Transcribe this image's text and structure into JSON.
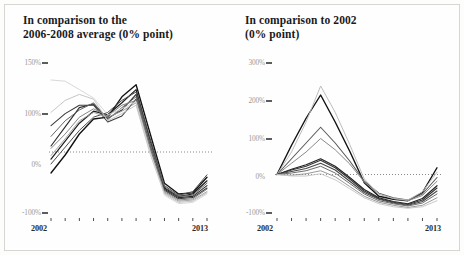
{
  "page": {
    "background_color": "#fdfdfc",
    "frame_color": "#d8d6d2"
  },
  "charts": [
    {
      "id": "left",
      "title": "In comparison to the\n2006-2008 average (0% point)",
      "title_line1": "In comparison to the",
      "title_line2": "2006-2008 average (0% point)",
      "y_ticks": [
        "150%",
        "100%",
        "0%",
        "-100%"
      ],
      "x_start_label": "2002",
      "x_end_label": "2013"
    },
    {
      "id": "right",
      "title": "In comparison to 2002\n(0% point)",
      "title_line1": "In comparison to 2002",
      "title_line2": "(0% point)",
      "y_ticks": [
        "300%",
        "200%",
        "100%",
        "0%",
        "-100%"
      ],
      "x_start_label": "2002",
      "x_end_label": "2013"
    }
  ],
  "chart_data": [
    {
      "type": "line",
      "title": "In comparison to the 2006-2008 average (0% point)",
      "xlabel": "",
      "ylabel": "",
      "x": [
        2002,
        2003,
        2004,
        2005,
        2006,
        2007,
        2008,
        2009,
        2010,
        2011,
        2012,
        2013
      ],
      "xlim": [
        2002,
        2013
      ],
      "ylim": [
        -100,
        150
      ],
      "ytick_values": [
        150,
        100,
        0,
        -100
      ],
      "ytick_labels": [
        "150%",
        "100%",
        "0%",
        "-100%"
      ],
      "grid": false,
      "zero_line": true,
      "zero_line_style": "dotted",
      "legend": "none",
      "series": [
        {
          "name": "series-1",
          "color": "#111111",
          "width": 1.35,
          "values": [
            -35,
            -5,
            30,
            55,
            58,
            92,
            112,
            30,
            -52,
            -70,
            -68,
            -42
          ]
        },
        {
          "name": "series-2",
          "color": "#1c1c1c",
          "width": 1.2,
          "values": [
            -12,
            18,
            48,
            68,
            62,
            82,
            104,
            18,
            -60,
            -74,
            -70,
            -48
          ]
        },
        {
          "name": "series-3",
          "color": "#2b2b2b",
          "width": 1.1,
          "values": [
            10,
            42,
            74,
            80,
            56,
            70,
            96,
            10,
            -62,
            -76,
            -74,
            -56
          ]
        },
        {
          "name": "series-4",
          "color": "#3a3a3a",
          "width": 1.05,
          "values": [
            44,
            64,
            78,
            78,
            50,
            60,
            88,
            4,
            -64,
            -78,
            -76,
            -60
          ]
        },
        {
          "name": "series-5",
          "color": "#4d4d4d",
          "width": 1.0,
          "values": [
            -20,
            8,
            36,
            58,
            66,
            86,
            100,
            22,
            -56,
            -72,
            -66,
            -38
          ]
        },
        {
          "name": "series-6",
          "color": "#666666",
          "width": 1.0,
          "values": [
            26,
            52,
            70,
            82,
            54,
            74,
            92,
            14,
            -58,
            -74,
            -72,
            -52
          ]
        },
        {
          "name": "series-7",
          "color": "#808080",
          "width": 0.95,
          "values": [
            6,
            30,
            58,
            72,
            60,
            78,
            86,
            8,
            -66,
            -80,
            -78,
            -62
          ]
        },
        {
          "name": "series-8",
          "color": "#9a9a9a",
          "width": 0.9,
          "values": [
            -6,
            22,
            52,
            66,
            58,
            68,
            82,
            2,
            -68,
            -82,
            -80,
            -66
          ]
        },
        {
          "name": "series-9",
          "color": "#bfbfbf",
          "width": 0.9,
          "values": [
            66,
            86,
            96,
            88,
            52,
            64,
            78,
            -4,
            -70,
            -84,
            -82,
            -68
          ]
        },
        {
          "name": "series-10",
          "color": "#d4d4d4",
          "width": 0.9,
          "values": [
            120,
            118,
            104,
            90,
            62,
            72,
            84,
            0,
            -72,
            -86,
            -84,
            -70
          ]
        }
      ]
    },
    {
      "type": "line",
      "title": "In comparison to 2002 (0% point)",
      "xlabel": "",
      "ylabel": "",
      "x": [
        2002,
        2003,
        2004,
        2005,
        2006,
        2007,
        2008,
        2009,
        2010,
        2011,
        2012,
        2013
      ],
      "xlim": [
        2002,
        2013
      ],
      "ylim": [
        -100,
        300
      ],
      "ytick_values": [
        300,
        200,
        100,
        0,
        -100
      ],
      "ytick_labels": [
        "300%",
        "200%",
        "100%",
        "0%",
        "-100%"
      ],
      "grid": false,
      "zero_line": true,
      "zero_line_style": "dotted",
      "legend": "none",
      "series": [
        {
          "name": "series-1",
          "color": "#111111",
          "width": 1.4,
          "values": [
            0,
            78,
            150,
            212,
            140,
            62,
            -22,
            -58,
            -66,
            -70,
            -48,
            18
          ]
        },
        {
          "name": "series-2",
          "color": "#5a5a5a",
          "width": 1.1,
          "values": [
            0,
            42,
            84,
            126,
            84,
            36,
            -18,
            -50,
            -62,
            -68,
            -52,
            -8
          ]
        },
        {
          "name": "series-3",
          "color": "#8a8a8a",
          "width": 1.0,
          "values": [
            0,
            30,
            60,
            96,
            66,
            28,
            -20,
            -52,
            -64,
            -70,
            -56,
            -18
          ]
        },
        {
          "name": "series-4",
          "color": "#b8b8b8",
          "width": 0.95,
          "values": [
            0,
            60,
            140,
            236,
            166,
            80,
            -12,
            -52,
            -64,
            -68,
            -46,
            6
          ]
        },
        {
          "name": "series-5",
          "color": "#222222",
          "width": 1.2,
          "values": [
            0,
            14,
            26,
            42,
            22,
            -8,
            -40,
            -62,
            -72,
            -78,
            -64,
            -30
          ]
        },
        {
          "name": "series-6",
          "color": "#333333",
          "width": 1.1,
          "values": [
            0,
            12,
            22,
            38,
            18,
            -12,
            -44,
            -64,
            -74,
            -80,
            -68,
            -36
          ]
        },
        {
          "name": "series-7",
          "color": "#474747",
          "width": 1.05,
          "values": [
            0,
            8,
            16,
            30,
            12,
            -18,
            -48,
            -66,
            -76,
            -82,
            -72,
            -44
          ]
        },
        {
          "name": "series-8",
          "color": "#6e6e6e",
          "width": 1.0,
          "values": [
            0,
            4,
            10,
            22,
            4,
            -24,
            -52,
            -70,
            -78,
            -84,
            -76,
            -52
          ]
        },
        {
          "name": "series-9",
          "color": "#949494",
          "width": 0.95,
          "values": [
            0,
            -2,
            2,
            10,
            -6,
            -32,
            -58,
            -74,
            -82,
            -88,
            -82,
            -62
          ]
        },
        {
          "name": "series-10",
          "color": "#c4c4c4",
          "width": 0.9,
          "values": [
            0,
            -4,
            -4,
            2,
            -14,
            -38,
            -62,
            -78,
            -86,
            -90,
            -86,
            -70
          ]
        }
      ]
    }
  ]
}
